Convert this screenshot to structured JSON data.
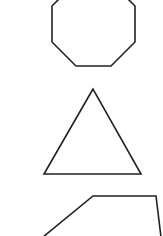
{
  "canvas": {
    "width": 163,
    "height": 236,
    "background": "#ffffff"
  },
  "stroke": {
    "color": "#222222",
    "width": 1.6
  },
  "shapes": [
    {
      "name": "octagon",
      "kind": "polyline",
      "points": "59,-1 52,6 52,42 76,66 111,66 135,42 135,6 128,-1"
    },
    {
      "name": "triangle",
      "kind": "polygon",
      "points": "93,89 44,174 141,174"
    },
    {
      "name": "trapezoid",
      "kind": "polyline",
      "points": "43,237 93,196 156,196 161,237"
    }
  ]
}
